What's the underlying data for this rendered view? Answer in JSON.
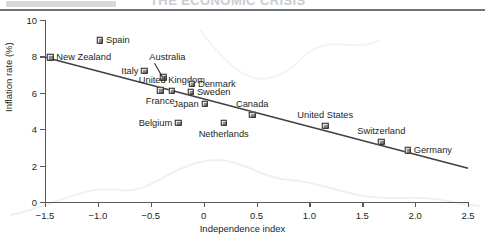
{
  "header": {
    "swatch_color": "#d9d9d9",
    "ghost_title": "THE ECONOMIC CRISIS",
    "rule_color": "#6f7479"
  },
  "chart_data": {
    "type": "scatter",
    "title": "",
    "xlabel": "Independence index",
    "ylabel": "Inflation rate (%)",
    "xlim": [
      -1.5,
      2.5
    ],
    "ylim": [
      0,
      10
    ],
    "xticks": [
      -1.5,
      -1.0,
      -0.5,
      0,
      0.5,
      1.0,
      1.5,
      2.0,
      2.5
    ],
    "xticklabels": [
      "−1.5",
      "−1.0",
      "−0.5",
      "0",
      "0.5",
      "1.0",
      "1.5",
      "2.0",
      "2.5"
    ],
    "yticks": [
      0,
      2,
      4,
      6,
      8,
      10
    ],
    "yticklabels": [
      "0",
      "2",
      "4",
      "6",
      "8",
      "10"
    ],
    "grid": false,
    "legend": "none",
    "marker_style": "open-square-shadow",
    "points": [
      {
        "label": "New Zealand",
        "x": -1.45,
        "y": 7.95,
        "label_pos": "right"
      },
      {
        "label": "Spain",
        "x": -0.98,
        "y": 8.9,
        "label_pos": "right"
      },
      {
        "label": "Italy",
        "x": -0.56,
        "y": 7.2,
        "label_pos": "left"
      },
      {
        "label": "Australia",
        "x": -0.38,
        "y": 6.85,
        "label_pos": "leader"
      },
      {
        "label": "United Kingdom",
        "x": -0.3,
        "y": 6.1,
        "label_pos": "above"
      },
      {
        "label": "France",
        "x": -0.41,
        "y": 6.15,
        "label_pos": "below"
      },
      {
        "label": "Denmark",
        "x": -0.11,
        "y": 6.5,
        "label_pos": "right"
      },
      {
        "label": "Sweden",
        "x": -0.12,
        "y": 6.05,
        "label_pos": "right"
      },
      {
        "label": "Japan",
        "x": 0.01,
        "y": 5.4,
        "label_pos": "left"
      },
      {
        "label": "Belgium",
        "x": -0.24,
        "y": 4.35,
        "label_pos": "left"
      },
      {
        "label": "Netherlands",
        "x": 0.19,
        "y": 4.35,
        "label_pos": "below"
      },
      {
        "label": "Canada",
        "x": 0.46,
        "y": 4.8,
        "label_pos": "above"
      },
      {
        "label": "United States",
        "x": 1.15,
        "y": 4.2,
        "label_pos": "above"
      },
      {
        "label": "Switzerland",
        "x": 1.68,
        "y": 3.3,
        "label_pos": "above"
      },
      {
        "label": "Germany",
        "x": 1.93,
        "y": 2.85,
        "label_pos": "right"
      }
    ],
    "trendline": {
      "x_start": -1.5,
      "y_start": 7.95,
      "x_end": 2.5,
      "y_end": 1.85,
      "color": "#3f4144"
    }
  }
}
